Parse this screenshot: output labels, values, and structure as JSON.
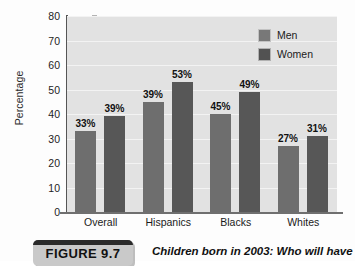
{
  "chart_data": {
    "type": "bar",
    "title": "",
    "xlabel": "",
    "ylabel": "Percentage",
    "ylim": [
      0,
      80
    ],
    "ytick_step": 10,
    "yticks": [
      80,
      70,
      60,
      50,
      40,
      30,
      20,
      10,
      0
    ],
    "grid": true,
    "legend_position": "top-right",
    "categories": [
      "Overall",
      "Hispanics",
      "Blacks",
      "Whites"
    ],
    "series": [
      {
        "name": "Men",
        "color": "#6e6e6e",
        "values": [
          33,
          45,
          40,
          27
        ],
        "labels": [
          "33%",
          "39%",
          "45%",
          "27%"
        ]
      },
      {
        "name": "Women",
        "color": "#575757",
        "values": [
          39,
          53,
          49,
          31
        ],
        "labels": [
          "39%",
          "53%",
          "49%",
          "31%"
        ]
      }
    ],
    "points": [
      {
        "category": "Overall",
        "series": "Men",
        "value": 33,
        "label": "33%"
      },
      {
        "category": "Overall",
        "series": "Women",
        "value": 39,
        "label": "39%"
      },
      {
        "category": "Hispanics",
        "series": "Men",
        "value": 45,
        "label": "45%"
      },
      {
        "category": "Hispanics",
        "series": "Women",
        "value": 53,
        "label": "53%"
      },
      {
        "category": "Blacks",
        "series": "Men",
        "value": 40,
        "label": "40%"
      },
      {
        "category": "Blacks",
        "series": "Women",
        "value": 49,
        "label": "49%"
      },
      {
        "category": "Whites",
        "series": "Men",
        "value": 27,
        "label": "27%"
      },
      {
        "category": "Whites",
        "series": "Women",
        "value": 31,
        "label": "31%"
      }
    ]
  },
  "legend": {
    "items": [
      {
        "label": "Men"
      },
      {
        "label": "Women"
      }
    ]
  },
  "axis": {
    "y_title": "Percentage",
    "y_tick_labels": [
      "80",
      "70",
      "60",
      "50",
      "40",
      "30",
      "20",
      "10",
      "0"
    ],
    "x_tick_labels": [
      "Overall",
      "Hispanics",
      "Blacks",
      "Whites"
    ]
  },
  "bar_value_labels": [
    "33%",
    "39%",
    "45%",
    "53%",
    "40%",
    "49%",
    "27%",
    "31%"
  ],
  "caption": {
    "figure_number": "FIGURE 9.7",
    "text": "Children born in 2003: Who will have"
  }
}
